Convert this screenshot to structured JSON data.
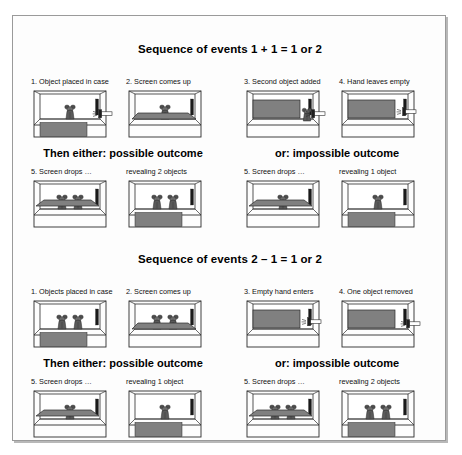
{
  "figure": {
    "background": "#ffffff",
    "frame_color": "#9a9a9a",
    "screen_color": "#808080",
    "floor_color": "#ffffff",
    "object_color": "#4d4d4d"
  },
  "sequences": [
    {
      "id": "addition",
      "heading": "Sequence of events 1 + 1 = 1 or 2",
      "steps": [
        {
          "label": "1. Object placed in case",
          "objects": 1,
          "screen": "down",
          "hand": "holding",
          "lower_panel": "gray"
        },
        {
          "label": "2. Screen comes up",
          "objects": 1,
          "screen": "rising",
          "hand": "none",
          "lower_panel": "white"
        },
        {
          "label": "3. Second object added",
          "objects": 1,
          "screen": "up",
          "hand": "holding",
          "lower_panel": "white"
        },
        {
          "label": "4. Hand leaves empty",
          "objects": 0,
          "screen": "up",
          "hand": "empty",
          "lower_panel": "white"
        }
      ],
      "outcomes": [
        {
          "banner": "Then either: possible outcome",
          "kind": "possible",
          "steps": [
            {
              "label": "5. Screen drops …",
              "objects": 2,
              "screen": "dropping",
              "lower_panel": "white"
            },
            {
              "label": "revealing 2 objects",
              "objects": 2,
              "screen": "down",
              "lower_panel": "gray"
            }
          ]
        },
        {
          "banner": "or: impossible outcome",
          "kind": "impossible",
          "steps": [
            {
              "label": "5. Screen drops …",
              "objects": 1,
              "screen": "dropping",
              "lower_panel": "white"
            },
            {
              "label": "revealing 1 object",
              "objects": 1,
              "screen": "down",
              "lower_panel": "gray"
            }
          ]
        }
      ]
    },
    {
      "id": "subtraction",
      "heading": "Sequence of events 2 – 1 = 1 or 2",
      "steps": [
        {
          "label": "1. Objects placed in case",
          "objects": 2,
          "screen": "down",
          "hand": "none",
          "lower_panel": "gray"
        },
        {
          "label": "2. Screen comes up",
          "objects": 2,
          "screen": "rising",
          "hand": "none",
          "lower_panel": "white"
        },
        {
          "label": "3. Empty hand enters",
          "objects": 0,
          "screen": "up",
          "hand": "empty",
          "lower_panel": "white"
        },
        {
          "label": "4. One object removed",
          "objects": 0,
          "screen": "up",
          "hand": "holding",
          "lower_panel": "white"
        }
      ],
      "outcomes": [
        {
          "banner": "Then either: possible outcome",
          "kind": "possible",
          "steps": [
            {
              "label": "5. Screen drops …",
              "objects": 1,
              "screen": "dropping",
              "lower_panel": "white"
            },
            {
              "label": "revealing 1 object",
              "objects": 1,
              "screen": "down",
              "lower_panel": "gray"
            }
          ]
        },
        {
          "banner": "or: impossible outcome",
          "kind": "impossible",
          "steps": [
            {
              "label": "5. Screen drops …",
              "objects": 2,
              "screen": "dropping",
              "lower_panel": "white"
            },
            {
              "label": "revealing 2 objects",
              "objects": 2,
              "screen": "down",
              "lower_panel": "gray"
            }
          ]
        }
      ]
    }
  ],
  "layout": {
    "panel_x": [
      30,
      125,
      243,
      338
    ],
    "seq_tops": [
      27,
      237
    ],
    "row_offsets": {
      "labels": 34,
      "stages": 46,
      "banner": 104,
      "out_labels": 124,
      "out_stages": 136
    }
  }
}
